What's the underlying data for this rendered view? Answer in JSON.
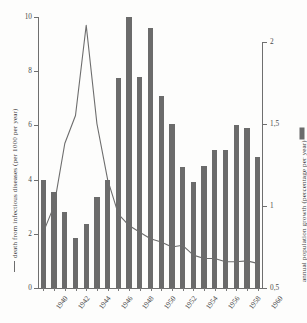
{
  "chart_data": {
    "type": "bar",
    "title": "",
    "subtitle": "",
    "xlabel": "",
    "ylabel": "death from infectious diseases (per 1000 per year)",
    "y2label": "annual population growth (percentage per year)",
    "grid": false,
    "legend_position": "axis-labels",
    "x": [
      1940,
      1941,
      1942,
      1943,
      1944,
      1945,
      1946,
      1947,
      1948,
      1949,
      1950,
      1951,
      1952,
      1953,
      1954,
      1955,
      1956,
      1957,
      1958,
      1959,
      1960
    ],
    "xtick_labels": [
      "1940",
      "1942",
      "1944",
      "1946",
      "1948",
      "1950",
      "1952",
      "1954",
      "1956",
      "1958",
      "1960"
    ],
    "xtick_values": [
      1940,
      1942,
      1944,
      1946,
      1948,
      1950,
      1952,
      1954,
      1956,
      1958,
      1960
    ],
    "ylim": [
      0,
      10
    ],
    "ytick_labels": [
      "0",
      "2",
      "4",
      "6",
      "8",
      "10"
    ],
    "ytick_values": [
      0,
      2,
      4,
      6,
      8,
      10
    ],
    "y2lim": [
      0.5,
      2.15
    ],
    "y2tick_labels": [
      "0,5",
      "1",
      "1,5",
      "2"
    ],
    "y2tick_values": [
      0.5,
      1,
      1.5,
      2
    ],
    "series": [
      {
        "name": "annual population growth (percentage per year)",
        "type": "bar",
        "axis": "left",
        "color": "#6b6b6b",
        "values": [
          4.0,
          3.55,
          2.8,
          1.85,
          2.35,
          3.35,
          4.0,
          7.75,
          10.0,
          7.8,
          9.6,
          7.1,
          6.05,
          4.45,
          3.9,
          4.5,
          5.1,
          5.1,
          6.0,
          5.9,
          4.85
        ]
      },
      {
        "name": "death from infectious diseases (per 1000 per year)",
        "type": "line",
        "axis": "right",
        "color": "#6d6d6d",
        "values": [
          0.84,
          1.0,
          1.38,
          1.55,
          2.1,
          1.5,
          1.16,
          0.95,
          0.88,
          0.84,
          0.8,
          0.78,
          0.75,
          0.76,
          0.7,
          0.68,
          0.68,
          0.66,
          0.66,
          0.665,
          0.65
        ]
      }
    ]
  },
  "axes": {
    "left_title": "death from infectious diseases (per 1000 per year)",
    "right_title": "annual population growth (percentage per year)"
  }
}
